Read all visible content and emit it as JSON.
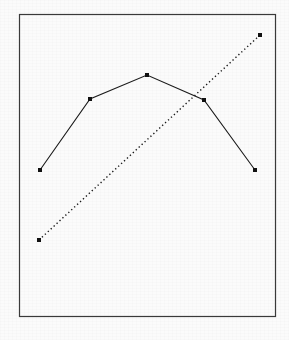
{
  "figure": {
    "width": 289,
    "height": 340,
    "background_color": "#fbfbfb",
    "frame": {
      "x": 19,
      "y": 14,
      "width": 257,
      "height": 303,
      "stroke_color": "#3a3a3a",
      "stroke_width": 1.2
    }
  },
  "chart_data": {
    "type": "line",
    "title": "",
    "subtitle": "",
    "xlabel": "",
    "ylabel": "",
    "xlim": [
      0,
      6
    ],
    "ylim": [
      0,
      6
    ],
    "grid": false,
    "legend_position": "none",
    "axis_ticks_visible": false,
    "tick_labels_x": [],
    "tick_labels_y": [],
    "annotations": [],
    "series": [
      {
        "name": "inverted-u-curve",
        "style": "solid",
        "color": "#1a1a1a",
        "line_width": 1.1,
        "marker": "square",
        "marker_size": 4,
        "marker_color": "#111111",
        "x": [
          1,
          2,
          3,
          4,
          5
        ],
        "values": [
          2.3,
          3.8,
          4.3,
          3.75,
          2.3
        ],
        "pixel_points": [
          [
            40,
            170
          ],
          [
            90,
            99
          ],
          [
            147,
            75
          ],
          [
            204,
            100
          ],
          [
            255,
            170
          ]
        ]
      },
      {
        "name": "rising-trend-line",
        "style": "dotted",
        "color": "#1a1a1a",
        "line_width": 1.4,
        "dot_spacing": 4,
        "marker": "square",
        "marker_size": 4,
        "marker_color": "#111111",
        "x": [
          1,
          5.1
        ],
        "values": [
          0.85,
          5.0
        ],
        "pixel_points": [
          [
            39,
            240
          ],
          [
            260,
            35
          ]
        ]
      }
    ],
    "intersection_pixel": [
      204,
      100
    ]
  }
}
